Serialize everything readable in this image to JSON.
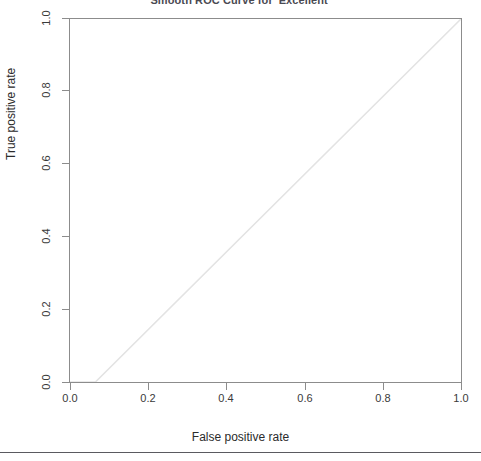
{
  "chart_data": {
    "type": "line",
    "title": "Smooth ROC Curve for 'Excellent'",
    "xlabel": "False positive rate",
    "ylabel": "True positive rate",
    "xlim": [
      0.0,
      1.0
    ],
    "ylim": [
      0.0,
      1.0
    ],
    "xticks": [
      "0.0",
      "0.2",
      "0.4",
      "0.6",
      "0.8",
      "1.0"
    ],
    "xtick_values": [
      0.0,
      0.2,
      0.4,
      0.6,
      0.8,
      1.0
    ],
    "yticks": [
      "0.0",
      "0.2",
      "0.4",
      "0.6",
      "0.8",
      "1.0"
    ],
    "ytick_values": [
      0.0,
      0.2,
      0.4,
      0.6,
      0.8,
      1.0
    ],
    "grid": false,
    "legend": false,
    "line_color": "#e3e3e3",
    "axis_color": "#8c8c8c",
    "series": [
      {
        "name": "ROC curve",
        "x": [
          0.0,
          0.065,
          1.0
        ],
        "y": [
          0.0,
          0.0,
          1.0
        ]
      }
    ]
  },
  "figure": {
    "background_color": "#ffffff",
    "divider_color": "#5a5a60"
  }
}
